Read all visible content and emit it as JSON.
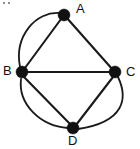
{
  "figure": {
    "width": 140,
    "height": 149,
    "background_color": "#ffffff",
    "ink_color": "#111111"
  },
  "chart_data": {
    "type": "diagram",
    "subtype": "node-link-graph",
    "title": "",
    "directed": false,
    "multigraph": true,
    "node_count": 4,
    "edge_count": 8,
    "nodes": [
      {
        "id": "A",
        "label": "A",
        "x": 64,
        "y": 15,
        "radius": 6,
        "label_x": 76,
        "label_y": 2
      },
      {
        "id": "B",
        "label": "B",
        "x": 22,
        "y": 72,
        "radius": 6,
        "label_x": 3,
        "label_y": 64
      },
      {
        "id": "C",
        "label": "C",
        "x": 115,
        "y": 72,
        "radius": 6,
        "label_x": 126,
        "label_y": 65
      },
      {
        "id": "D",
        "label": "D",
        "x": 73,
        "y": 128,
        "radius": 6,
        "label_x": 68,
        "label_y": 134
      }
    ],
    "edges": [
      {
        "source": "A",
        "target": "B",
        "style": "straight"
      },
      {
        "source": "A",
        "target": "B",
        "style": "curved",
        "bulge": "left"
      },
      {
        "source": "A",
        "target": "C",
        "style": "straight"
      },
      {
        "source": "B",
        "target": "C",
        "style": "straight"
      },
      {
        "source": "B",
        "target": "D",
        "style": "straight"
      },
      {
        "source": "B",
        "target": "D",
        "style": "curved",
        "bulge": "lower-left"
      },
      {
        "source": "C",
        "target": "D",
        "style": "straight"
      },
      {
        "source": "C",
        "target": "D",
        "style": "curved",
        "bulge": "lower-right"
      }
    ],
    "adjacency_note": "A-B double, A-C single, B-C single, B-D double, C-D double, A-D none"
  },
  "paths": {
    "edge_ab_straight": "M 64 15 L 22 72",
    "edge_ab_curved": "M 60 13 C 36 11 14 36 20 67",
    "edge_ac_straight": "M 66 17 L 113 70",
    "edge_bc_straight": "M 22 72 L 115 72",
    "edge_bd_straight": "M 24 77 L 71 125",
    "edge_bd_curved": "M 21 79 C 18 104 40 126 68 128",
    "edge_cd_straight": "M 113 77 L 76 125",
    "edge_cd_curved": "M 118 77 C 128 98 125 122 78 129"
  }
}
